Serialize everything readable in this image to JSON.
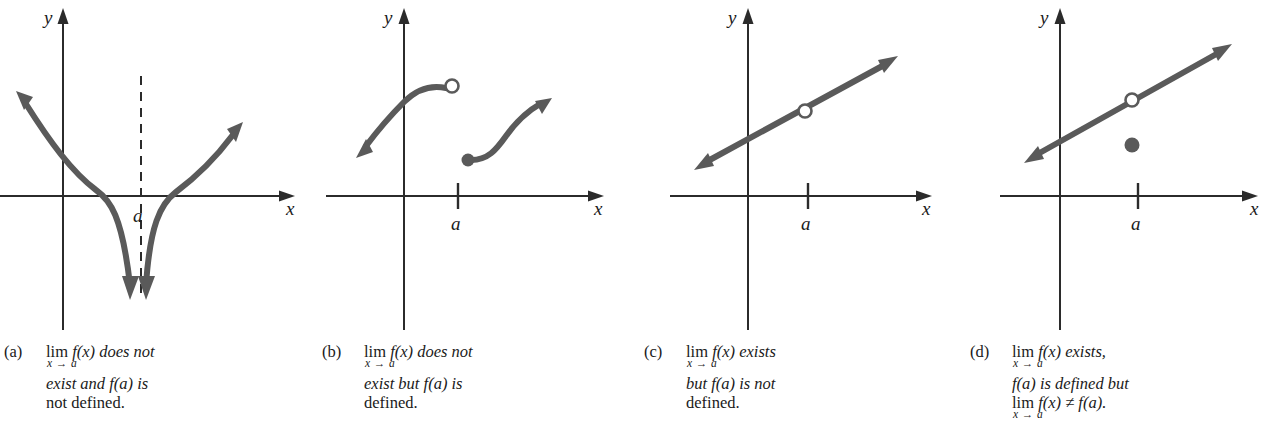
{
  "figure": {
    "background_color": "#ffffff",
    "curve_color": "#5a5a5a",
    "axis_color": "#2b2b2b",
    "text_color": "#1a1a1a",
    "panel_count": 4
  },
  "axis_labels": {
    "x": "x",
    "y": "y",
    "point": "a"
  },
  "panels": [
    {
      "tag": "(a)",
      "graph": {
        "description": "two branches descending to negative infinity at a dashed vertical asymptote",
        "has_dashed_asymptote": true,
        "has_open_circle": false,
        "has_filled_dot": false,
        "tick_label": "a"
      },
      "caption": {
        "lines": [
          {
            "type": "limit",
            "head": "lim",
            "sub": "x → a",
            "tail": "f(x) does not"
          },
          {
            "type": "text",
            "text": "exist and f(a) is"
          },
          {
            "type": "text",
            "text": "not defined."
          }
        ]
      }
    },
    {
      "tag": "(b)",
      "graph": {
        "description": "jump discontinuity: left branch ends at open circle, right branch begins at filled dot",
        "has_dashed_asymptote": false,
        "has_open_circle": true,
        "has_filled_dot": true,
        "tick_label": "a"
      },
      "caption": {
        "lines": [
          {
            "type": "limit",
            "head": "lim",
            "sub": "x → a",
            "tail": "f(x) does not"
          },
          {
            "type": "text",
            "text": "exist but f(a) is"
          },
          {
            "type": "text",
            "text": "defined."
          }
        ]
      }
    },
    {
      "tag": "(c)",
      "graph": {
        "description": "straight increasing line with a hole at x = a",
        "has_dashed_asymptote": false,
        "has_open_circle": true,
        "has_filled_dot": false,
        "tick_label": "a"
      },
      "caption": {
        "lines": [
          {
            "type": "limit",
            "head": "lim",
            "sub": "x → a",
            "tail": "f(x) exists"
          },
          {
            "type": "text",
            "text": "but f(a) is not"
          },
          {
            "type": "text",
            "text": "defined."
          }
        ]
      }
    },
    {
      "tag": "(d)",
      "graph": {
        "description": "straight increasing line with a hole at x = a and a filled dot below the line",
        "has_dashed_asymptote": false,
        "has_open_circle": true,
        "has_filled_dot": true,
        "tick_label": "a"
      },
      "caption": {
        "lines": [
          {
            "type": "limit",
            "head": "lim",
            "sub": "x → a",
            "tail": "f(x) exists,"
          },
          {
            "type": "text",
            "text": "f(a) is defined but"
          },
          {
            "type": "limit",
            "head": "lim",
            "sub": "x → a",
            "tail": "f(x) ≠ f(a)."
          }
        ]
      }
    }
  ]
}
